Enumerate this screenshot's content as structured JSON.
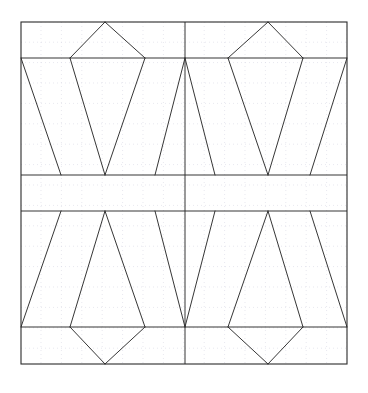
{
  "figure": {
    "canvas": {
      "width": 368,
      "height": 393,
      "background": "#ffffff"
    },
    "grid": {
      "visible": true,
      "style": "dotted",
      "color": "#d8d8e4",
      "spacing": 20.4,
      "origin_x": 20.6,
      "origin_y": 21.8,
      "line_width": 0.6
    },
    "frame": {
      "x1": 21,
      "y1": 22,
      "x2": 347,
      "y2": 364,
      "color": "#2b2b2b",
      "line_width": 1.1
    },
    "stroke": {
      "color": "#2b2b2b",
      "width": 0.95
    },
    "guides": {
      "horizontal_y": [
        58,
        175,
        211,
        327
      ],
      "vertical_x": [
        185
      ]
    },
    "geometry": {
      "left": 21,
      "right": 347,
      "top": 22,
      "bottom": 364,
      "center_x": 185,
      "band_top_y": 58,
      "mid_upper_y": 175,
      "mid_lower_y": 211,
      "band_bottom_y": 327,
      "apex_left_x": 105,
      "apex_right_x": 268,
      "pent_left_x": 70,
      "pent_right_x": 145,
      "pent_left_x2": 228,
      "pent_right_x2": 303,
      "vee_left_x": 105,
      "vee_right_x": 268,
      "slant_left_bottom_x": 61,
      "slant_inner_left_x": 155,
      "slant_inner_right_x": 215,
      "slant_right_bottom_x": 310
    },
    "polylines": [
      {
        "name": "upper-left-pentagon-left-diagonal",
        "points": "105,22 70,58"
      },
      {
        "name": "upper-left-pentagon-right-diagonal",
        "points": "105,22 145,58"
      },
      {
        "name": "upper-left-trapezoid-outer-left",
        "points": "21,58 61,175"
      },
      {
        "name": "upper-left-funnel-left",
        "points": "70,58 105,175"
      },
      {
        "name": "upper-left-funnel-right",
        "points": "145,58 105,175"
      },
      {
        "name": "upper-center-left-slant",
        "points": "185,58 155,175"
      },
      {
        "name": "upper-right-pentagon-left-diagonal",
        "points": "268,22 228,58"
      },
      {
        "name": "upper-right-pentagon-right-diagonal",
        "points": "268,22 303,58"
      },
      {
        "name": "upper-center-right-slant",
        "points": "185,58 215,175"
      },
      {
        "name": "upper-right-funnel-left",
        "points": "228,58 268,175"
      },
      {
        "name": "upper-right-funnel-right",
        "points": "303,58 268,175"
      },
      {
        "name": "upper-right-trapezoid-outer-right",
        "points": "347,58 310,175"
      },
      {
        "name": "lower-left-trapezoid-outer-left",
        "points": "21,327 61,211"
      },
      {
        "name": "lower-left-funnel-left",
        "points": "70,327 105,211"
      },
      {
        "name": "lower-left-funnel-right",
        "points": "145,327 105,211"
      },
      {
        "name": "lower-center-left-slant",
        "points": "185,327 155,211"
      },
      {
        "name": "lower-left-pentagon-left-diagonal",
        "points": "105,364 70,327"
      },
      {
        "name": "lower-left-pentagon-right-diagonal",
        "points": "105,364 145,327"
      },
      {
        "name": "lower-center-right-slant",
        "points": "185,327 215,211"
      },
      {
        "name": "lower-right-funnel-left",
        "points": "228,327 268,211"
      },
      {
        "name": "lower-right-funnel-right",
        "points": "303,327 268,211"
      },
      {
        "name": "lower-right-trapezoid-outer-right",
        "points": "347,327 310,211"
      },
      {
        "name": "lower-right-pentagon-left-diagonal",
        "points": "268,364 228,327"
      },
      {
        "name": "lower-right-pentagon-right-diagonal",
        "points": "268,364 303,327"
      }
    ]
  }
}
